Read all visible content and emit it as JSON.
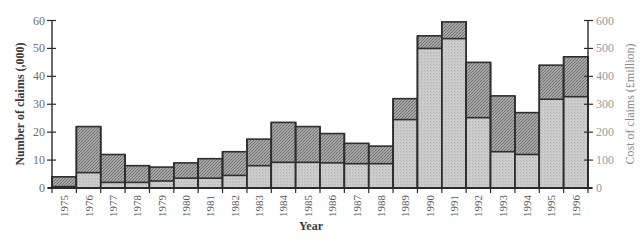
{
  "chart_data": {
    "type": "bar",
    "title": "",
    "xlabel": "Year",
    "ylabel": "Number of claims (,000)",
    "ylabel_right": "Cost of claims (£million)",
    "ylim": [
      0,
      60
    ],
    "ylim_right": [
      0,
      600
    ],
    "yticks": [
      0,
      10,
      20,
      30,
      40,
      50,
      60
    ],
    "yticks_right": [
      0,
      100,
      200,
      300,
      400,
      500,
      600
    ],
    "grid": false,
    "legend": null,
    "categories": [
      "1975",
      "1976",
      "1977",
      "1978",
      "1979",
      "1980",
      "1981",
      "1982",
      "1983",
      "1984",
      "1985",
      "1986",
      "1987",
      "1988",
      "1989",
      "1990",
      "1991",
      "1992",
      "1993",
      "1994",
      "1995",
      "1996"
    ],
    "series": [
      {
        "name": "Number of claims (,000)",
        "axis": "left",
        "style": "dark hatched",
        "values": [
          4,
          22,
          12,
          8,
          7.5,
          9,
          10.5,
          13,
          17.5,
          23.5,
          22,
          19.5,
          16,
          15,
          32,
          54.5,
          59.5,
          45,
          33,
          27,
          44,
          47
        ]
      },
      {
        "name": "Cost of claims (£million)",
        "axis": "right",
        "style": "light stippled",
        "values": [
          5,
          55,
          20,
          20,
          25,
          35,
          35,
          45,
          80,
          92,
          92,
          90,
          87,
          87,
          245,
          500,
          535,
          252,
          130,
          120,
          318,
          327
        ]
      }
    ]
  },
  "colors": {
    "claims_fill": "#a3a3a3",
    "claims_fill_alt": "#7d7d7d",
    "cost_fill": "#cacaca",
    "cost_fill_alt": "#b4b4b4",
    "outline": "#2e2e2e",
    "axis": "#2a2a2a"
  }
}
